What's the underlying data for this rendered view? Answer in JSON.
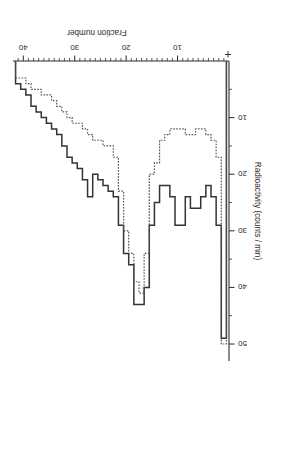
{
  "chart_data": {
    "type": "line",
    "subtype": "step-histogram",
    "title": "",
    "xlabel": "Fraction number",
    "ylabel": "Radioactivity (counts / min)",
    "xlim": [
      0,
      42
    ],
    "ylim": [
      0,
      53
    ],
    "xticks": [
      10,
      20,
      30,
      40
    ],
    "yticks": [
      10,
      20,
      30,
      40,
      50
    ],
    "xtick_labels": [
      "10",
      "20",
      "30",
      "40"
    ],
    "ytick_labels": [
      "10",
      "20",
      "30",
      "40",
      "50"
    ],
    "grid": false,
    "legend": null,
    "legend_position": "none",
    "annotations": [
      {
        "text": "+",
        "x": 1.0,
        "y": 2.0,
        "note": "origin marker near start of elution"
      }
    ],
    "x": [
      1,
      2,
      3,
      4,
      5,
      6,
      7,
      8,
      9,
      10,
      11,
      12,
      13,
      14,
      15,
      16,
      17,
      18,
      19,
      20,
      21,
      22,
      23,
      24,
      25,
      26,
      27,
      28,
      29,
      30,
      31,
      32,
      33,
      34,
      35,
      36,
      37,
      38,
      39,
      40,
      41
    ],
    "series": [
      {
        "name": "solid trace",
        "style": "solid",
        "color": "#333333",
        "values": [
          49,
          29,
          24,
          22,
          24,
          26,
          26,
          24,
          29,
          29,
          24,
          22,
          22,
          25,
          29,
          40,
          43,
          43,
          36,
          34,
          29,
          24,
          23,
          22,
          21,
          20,
          24,
          21,
          19,
          18,
          17,
          15,
          13,
          12,
          11,
          10,
          9,
          8,
          6,
          5,
          4
        ]
      },
      {
        "name": "dotted trace",
        "style": "dotted",
        "color": "#555555",
        "values": [
          50,
          17,
          14,
          13,
          12,
          12,
          13,
          13,
          12,
          12,
          12,
          13,
          14,
          18,
          20,
          34,
          41,
          39,
          34,
          30,
          23,
          17,
          15,
          15,
          14,
          14,
          13,
          12,
          11,
          11,
          10,
          9,
          8,
          7,
          6,
          6,
          5,
          5,
          4,
          3,
          3
        ]
      }
    ]
  }
}
